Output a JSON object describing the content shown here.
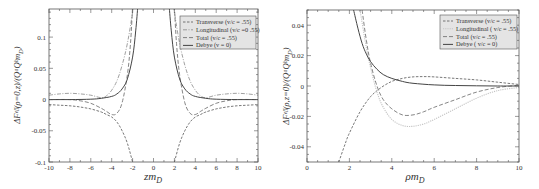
{
  "chart_data": [
    {
      "type": "line",
      "title": "",
      "xlabel": "zm_D",
      "ylabel": "ΔF^eff(ρ=0,z)/(Q^a Q^b m_D)",
      "xlim": [
        -10,
        10
      ],
      "ylim": [
        -0.1,
        0.145
      ],
      "xticks": [
        -10,
        -8,
        -6,
        -4,
        -2,
        0,
        2,
        4,
        6,
        8,
        10
      ],
      "xtick_labels": [
        "-10",
        "-8",
        "-6",
        "-4",
        "-2",
        "0",
        "2",
        "4",
        "6",
        "8",
        "10"
      ],
      "yticks": [
        -0.1,
        -0.05,
        0,
        0.05,
        0.1
      ],
      "ytick_labels": [
        "-0.1",
        "-0.05",
        "0",
        "0.05",
        "0.1"
      ],
      "grid": false,
      "legend_position": "upper right",
      "legend": [
        "Transverse (v/c = .55)",
        "Longitudinal (v/c =0 .55)",
        "Total (v/c = .55)",
        "Debye (v = 0)"
      ],
      "series": [
        {
          "name": "Transverse (v/c = .55)",
          "style": "dashed",
          "x": [
            -10,
            -9,
            -8,
            -7,
            -6,
            -5,
            -4.5,
            -4,
            -3.5,
            -3,
            -2.5,
            -2,
            2,
            2.5,
            3,
            3.5,
            4,
            4.5,
            5,
            6,
            7,
            8,
            9,
            10
          ],
          "y": [
            -0.008,
            -0.009,
            -0.01,
            -0.012,
            -0.015,
            -0.02,
            -0.024,
            -0.028,
            -0.036,
            -0.05,
            -0.07,
            -0.1,
            -0.1,
            -0.07,
            -0.05,
            -0.036,
            -0.028,
            -0.024,
            -0.02,
            -0.015,
            -0.012,
            -0.01,
            -0.009,
            -0.008
          ]
        },
        {
          "name": "Longitudinal (v/c =0 .55)",
          "style": "dash-dot",
          "x": [
            -10,
            -9,
            -8,
            -7,
            -6,
            -5,
            -4.5,
            -4,
            -3.5,
            -3,
            -2.5,
            -2,
            -1.5,
            1.5,
            2,
            2.5,
            3,
            3.5,
            4,
            4.5,
            5,
            6,
            7,
            8,
            9,
            10
          ],
          "y": [
            0.007,
            0.009,
            0.01,
            0.009,
            0.007,
            0.003,
            0.006,
            0.015,
            0.03,
            0.055,
            0.09,
            0.14,
            0.2,
            0.2,
            0.14,
            0.09,
            0.055,
            0.03,
            0.015,
            0.006,
            0.003,
            0.007,
            0.009,
            0.01,
            0.009,
            0.007
          ]
        },
        {
          "name": "Total (v/c = .55)",
          "style": "dashed-long",
          "x": [
            -10,
            -8,
            -7,
            -6,
            -5,
            -4.5,
            -4,
            -3.5,
            -3,
            -2.5,
            -2.2,
            -2,
            2,
            2.2,
            2.5,
            3,
            3.5,
            4,
            4.5,
            5,
            6,
            7,
            8,
            10
          ],
          "y": [
            0.0,
            0.0,
            -0.002,
            -0.006,
            -0.014,
            -0.019,
            -0.024,
            -0.022,
            -0.005,
            0.04,
            0.09,
            0.15,
            0.15,
            0.09,
            0.04,
            -0.005,
            -0.022,
            -0.024,
            -0.019,
            -0.014,
            -0.006,
            -0.002,
            0.0,
            0.0
          ]
        },
        {
          "name": "Debye (v = 0)",
          "style": "solid",
          "x": [
            -10,
            -8,
            -6,
            -5,
            -4,
            -3.5,
            -3,
            -2.5,
            -2,
            -1.7,
            -1.5,
            1.5,
            1.7,
            2,
            2.5,
            3,
            3.5,
            4,
            5,
            6,
            8,
            10
          ],
          "y": [
            0.0,
            0.0,
            0.0005,
            0.002,
            0.005,
            0.009,
            0.017,
            0.033,
            0.068,
            0.11,
            0.15,
            0.15,
            0.11,
            0.068,
            0.033,
            0.017,
            0.009,
            0.005,
            0.002,
            0.0005,
            0.0,
            0.0
          ]
        }
      ]
    },
    {
      "type": "line",
      "title": "",
      "xlabel": "ρm_D",
      "ylabel": "ΔF^eff(ρ,z=0)/(Q^a Q^b m_D)",
      "xlim": [
        0,
        10
      ],
      "ylim": [
        -0.05,
        0.05
      ],
      "xticks": [
        0,
        2,
        4,
        6,
        8,
        10
      ],
      "xtick_labels": [
        "0",
        "2",
        "4",
        "6",
        "8",
        "10"
      ],
      "yticks": [
        -0.04,
        -0.02,
        0,
        0.02,
        0.04
      ],
      "ytick_labels": [
        "-0.04",
        "-0.02",
        "0",
        "0.02",
        "0.04"
      ],
      "grid": false,
      "legend_position": "upper right",
      "legend": [
        "Transverse (v/c = .55)",
        "Longitudinal ( v/c = .55)",
        "Total (v/c = .55)",
        "Debye ( v/c = 0)"
      ],
      "series": [
        {
          "name": "Transverse (v/c = .55)",
          "style": "dashed",
          "x": [
            1.5,
            1.8,
            2,
            2.5,
            3,
            3.5,
            4,
            4.5,
            5,
            5.5,
            6,
            7,
            8,
            9,
            10
          ],
          "y": [
            -0.05,
            -0.038,
            -0.031,
            -0.017,
            -0.007,
            -0.001,
            0.003,
            0.005,
            0.006,
            0.0062,
            0.006,
            0.005,
            0.004,
            0.0025,
            0.001
          ]
        },
        {
          "name": "Longitudinal ( v/c = .55)",
          "style": "dotted-light",
          "x": [
            2.5,
            2.8,
            3,
            3.3,
            3.6,
            4,
            4.5,
            5,
            5.5,
            6,
            7,
            8,
            9,
            10
          ],
          "y": [
            0.05,
            0.025,
            0.012,
            -0.004,
            -0.014,
            -0.022,
            -0.026,
            -0.0265,
            -0.025,
            -0.022,
            -0.015,
            -0.008,
            -0.003,
            -0.001
          ]
        },
        {
          "name": "Total (v/c = .55)",
          "style": "dashed-long",
          "x": [
            2.6,
            2.8,
            3,
            3.3,
            3.6,
            4,
            4.5,
            5,
            5.5,
            6,
            7,
            8,
            9,
            10
          ],
          "y": [
            0.05,
            0.03,
            0.015,
            0.0,
            -0.009,
            -0.015,
            -0.019,
            -0.019,
            -0.017,
            -0.014,
            -0.009,
            -0.004,
            -0.001,
            0.0005
          ]
        },
        {
          "name": "Debye ( v/c = 0)",
          "style": "solid",
          "x": [
            2.2,
            2.4,
            2.6,
            2.8,
            3,
            3.3,
            3.6,
            4,
            4.5,
            5,
            6,
            7,
            8,
            9,
            10
          ],
          "y": [
            0.05,
            0.038,
            0.028,
            0.021,
            0.016,
            0.011,
            0.0075,
            0.005,
            0.003,
            0.0018,
            0.0007,
            0.0003,
            0.0001,
            0.0,
            0.0
          ]
        }
      ]
    }
  ],
  "legends": {
    "left": [
      "Transverse (v/c = .55)",
      "Longitudinal (v/c =0 .55)",
      "Total (v/c = .55)",
      "Debye (v = 0)"
    ],
    "right": [
      "Transverse (v/c = .55)",
      "Longitudinal ( v/c = .55)",
      "Total (v/c = .55)",
      "Debye ( v/c = 0)"
    ]
  },
  "labels": {
    "left_xlabel": "zm",
    "left_xlabel_sub": "D",
    "left_ylabel": "ΔFᵉᶠᶠ(ρ=0,z)/(QᵃQᵇm",
    "left_ylabel_sub": "D",
    "right_xlabel": "ρm",
    "right_xlabel_sub": "D",
    "right_ylabel": "ΔFᵉᶠᶠ(ρ,z=0)/(QᵃQᵇm",
    "right_ylabel_sub": "D"
  },
  "colors": {
    "frame": "#555555",
    "transverse": "#555555",
    "longitudinal": "#888888",
    "longitudinal_right": "#c8c8c8",
    "total": "#666666",
    "debye": "#444444",
    "legend_bg": "#e4e4e4"
  }
}
